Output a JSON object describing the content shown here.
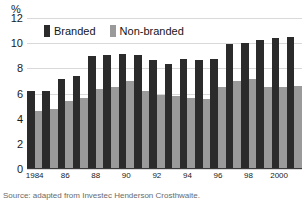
{
  "figure": {
    "headline_clipped": "",
    "unit_label": "%",
    "source_note": "Source: adapted from Investec Henderson Crosthwaite.",
    "colors": {
      "branded": "#2b2b2b",
      "nonbranded": "#9a9a9a",
      "gridline": "#d9d9d9",
      "axis": "#3a3a3a",
      "background": "#ffffff"
    }
  },
  "legend": {
    "position": "top-left-inside",
    "items": [
      {
        "label": "Branded",
        "color": "#2b2b2b",
        "key": "branded"
      },
      {
        "label": "Non-branded",
        "color": "#9a9a9a",
        "key": "nonbranded"
      }
    ]
  },
  "chart_data": {
    "type": "bar",
    "title": "",
    "xlabel": "",
    "ylabel": "%",
    "ylim": [
      0,
      12
    ],
    "yticks": [
      0,
      2,
      4,
      6,
      8,
      10,
      12
    ],
    "ytick_labels": [
      "0",
      "2",
      "4",
      "6",
      "8",
      "10",
      "12"
    ],
    "grid": true,
    "grid_axis": "y",
    "legend_position": "upper left",
    "categories": [
      "1984",
      "1985",
      "1986",
      "1987",
      "1988",
      "1989",
      "1990",
      "1991",
      "1992",
      "1993",
      "1994",
      "1995",
      "1996",
      "1997",
      "1998",
      "1999",
      "2000",
      "2001"
    ],
    "xtick_labels": [
      "1984",
      "",
      "86",
      "",
      "88",
      "",
      "90",
      "",
      "92",
      "",
      "94",
      "",
      "96",
      "",
      "98",
      "",
      "2000",
      ""
    ],
    "series": [
      {
        "name": "Branded",
        "color": "#2b2b2b",
        "values": [
          6.1,
          6.1,
          7.1,
          7.35,
          8.9,
          9.0,
          9.05,
          8.95,
          8.55,
          8.3,
          8.65,
          8.6,
          8.7,
          9.85,
          9.9,
          10.2,
          10.35,
          10.4
        ]
      },
      {
        "name": "Non-branded",
        "color": "#9a9a9a",
        "values": [
          4.5,
          4.7,
          5.35,
          5.6,
          6.25,
          6.45,
          6.9,
          6.15,
          5.8,
          5.75,
          5.6,
          5.5,
          6.4,
          6.9,
          7.1,
          6.45,
          6.45,
          6.5
        ]
      }
    ]
  }
}
